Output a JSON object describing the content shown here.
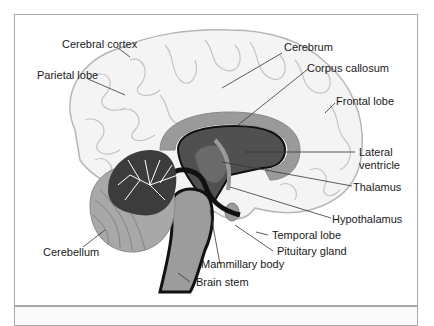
{
  "diagram": {
    "type": "anatomy",
    "labels": [
      {
        "id": "cerebral-cortex",
        "text": "Cerebral cortex"
      },
      {
        "id": "parietal-lobe",
        "text": "Parietal lobe"
      },
      {
        "id": "cerebrum",
        "text": "Cerebrum"
      },
      {
        "id": "corpus-callosum",
        "text": "Corpus callosum"
      },
      {
        "id": "frontal-lobe",
        "text": "Frontal lobe"
      },
      {
        "id": "lateral-ventricle",
        "text": "Lateral\nventricle",
        "line1": "Lateral",
        "line2": "ventricle"
      },
      {
        "id": "thalamus",
        "text": "Thalamus"
      },
      {
        "id": "hypothalamus",
        "text": "Hypothalamus"
      },
      {
        "id": "temporal-lobe",
        "text": "Temporal lobe"
      },
      {
        "id": "pituitary-gland",
        "text": "Pituitary gland"
      },
      {
        "id": "mammillary-body",
        "text": "Mammillary body"
      },
      {
        "id": "brain-stem",
        "text": "Brain stem"
      },
      {
        "id": "cerebellum",
        "text": "Cerebellum"
      }
    ],
    "colors": {
      "cortex_fill": "#f4f4f4",
      "cortex_stroke": "#b5b5b5",
      "corpus_callosum": "#9a9a9a",
      "ventricle": "#505050",
      "thalamus": "#6a6a6a",
      "black_outline": "#111111",
      "brainstem": "#9c9c9c",
      "cerebellum_outer": "#a8a8a8",
      "cerebellum_inner": "#3c3c3c",
      "border": "#a8a8a8"
    }
  }
}
